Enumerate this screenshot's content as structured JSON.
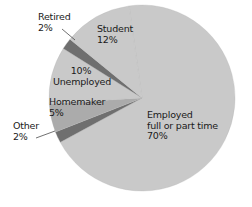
{
  "chart_data": {
    "type": "pie",
    "title": "",
    "categories": [
      "Employed full or part time",
      "Other",
      "Homemaker",
      "Unemployed",
      "Retired",
      "Student"
    ],
    "values": [
      70,
      2,
      5,
      10,
      2,
      12
    ],
    "unit": "%",
    "colors": [
      "#c9c9c9",
      "#6f6f6f",
      "#ababab",
      "#c9c9c9",
      "#6f6f6f",
      "#c9c9c9"
    ],
    "legend": "none (direct labels)",
    "labels": [
      {
        "line1": "Employed",
        "line2": "full or part time",
        "line3": "70%"
      },
      {
        "line1": "Other",
        "line2": "2%"
      },
      {
        "line1": "Homemaker",
        "line2": "5%"
      },
      {
        "line1": "10%",
        "line2": "Unemployed"
      },
      {
        "line1": "Retired",
        "line2": "2%"
      },
      {
        "line1": "Student",
        "line2": "12%"
      }
    ]
  }
}
